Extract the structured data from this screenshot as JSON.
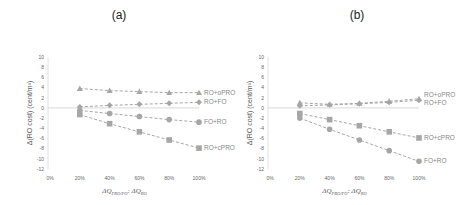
{
  "panels": [
    {
      "id": "a",
      "title": "(a)"
    },
    {
      "id": "b",
      "title": "(b)"
    }
  ],
  "axes": {
    "ylabel": "Δ(RO cost) (cent/m³)",
    "xlabel_main": "ΔQ",
    "xlabel_sub1": "PRO/FO",
    "xlabel_sep": ": ΔQ",
    "xlabel_sub2": "RO",
    "yticks": [
      "10",
      "8",
      "6",
      "4",
      "2",
      "0",
      "-2",
      "-4",
      "-6",
      "-8",
      "-10",
      "-12"
    ],
    "xticks": [
      "0%",
      "20%",
      "40%",
      "60%",
      "80%",
      "100%"
    ]
  },
  "colors": {
    "series": "#a6a6a6",
    "axis": "#d9d9d9",
    "label": "#8c8c8c"
  },
  "chart_data": [
    {
      "type": "line",
      "title": "(a)",
      "xlabel": "ΔQ_PRO/FO : ΔQ_RO",
      "ylabel": "Δ(RO cost) (cent/m³)",
      "x": [
        "20%",
        "40%",
        "60%",
        "80%",
        "100%"
      ],
      "x_ticks": [
        "0%",
        "20%",
        "40%",
        "60%",
        "80%",
        "100%"
      ],
      "ylim": [
        -12,
        10
      ],
      "grid": false,
      "legend": "inline labels at right",
      "series": [
        {
          "name": "RO+oPRO",
          "marker": "triangle",
          "values": [
            3.8,
            3.4,
            3.2,
            3.0,
            3.0
          ]
        },
        {
          "name": "RO+FO",
          "marker": "diamond",
          "values": [
            0.2,
            0.5,
            0.7,
            0.9,
            1.1
          ]
        },
        {
          "name": "FO+RO",
          "marker": "circle",
          "values": [
            -0.5,
            -1.1,
            -1.7,
            -2.3,
            -2.8
          ]
        },
        {
          "name": "RO+cPRO",
          "marker": "square",
          "values": [
            -1.3,
            -3.1,
            -4.7,
            -6.3,
            -7.9
          ]
        }
      ]
    },
    {
      "type": "line",
      "title": "(b)",
      "xlabel": "ΔQ_PRO/FO : ΔQ_RO",
      "ylabel": "Δ(RO cost) (cent/m³)",
      "x": [
        "20%",
        "40%",
        "60%",
        "80%",
        "100%"
      ],
      "x_ticks": [
        "0%",
        "20%",
        "40%",
        "60%",
        "80%",
        "100%"
      ],
      "ylim": [
        -12,
        10
      ],
      "grid": false,
      "legend": "inline labels at right",
      "series": [
        {
          "name": "RO+oPRO",
          "marker": "triangle",
          "values": [
            1.0,
            0.7,
            0.9,
            1.3,
            1.8
          ]
        },
        {
          "name": "RO+FO",
          "marker": "diamond",
          "values": [
            0.4,
            0.6,
            0.8,
            1.1,
            1.5
          ]
        },
        {
          "name": "RO+cPRO",
          "marker": "square",
          "values": [
            -1.1,
            -2.3,
            -3.5,
            -4.7,
            -5.9
          ]
        },
        {
          "name": "FO+RO",
          "marker": "circle",
          "values": [
            -2.0,
            -4.2,
            -6.3,
            -8.4,
            -10.5
          ]
        }
      ]
    }
  ]
}
